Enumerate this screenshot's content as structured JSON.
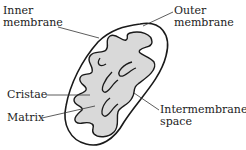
{
  "diagram": {
    "labels": {
      "inner_membrane": {
        "line1": "Inner",
        "line2": "membrane"
      },
      "outer_membrane": {
        "line1": "Outer",
        "line2": "membrane"
      },
      "cristae": "Cristae",
      "matrix": "Matrix",
      "intermembrane_space": {
        "line1": "Intermembrane",
        "line2": "space"
      }
    },
    "colors": {
      "outline": "#1a1a1a",
      "matrix_fill": "#d9d9d9",
      "background": "#ffffff",
      "leader_line": "#333333"
    }
  }
}
